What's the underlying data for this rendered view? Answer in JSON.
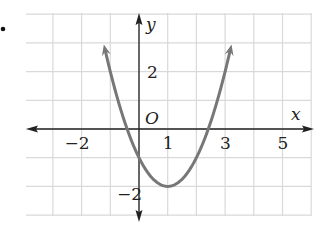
{
  "chart_data": {
    "type": "line",
    "title": "",
    "xlabel": "x",
    "ylabel": "y",
    "origin_label": "O",
    "xlim": [
      -4,
      6
    ],
    "ylim": [
      -3,
      4
    ],
    "grid": true,
    "x_ticks": [
      -2,
      1,
      3,
      5
    ],
    "x_tick_labels": [
      "−2",
      "1",
      "3",
      "5"
    ],
    "y_ticks": [
      2,
      -2
    ],
    "y_tick_labels": [
      "2",
      "−2"
    ],
    "series": [
      {
        "name": "y = x² − 2x − 1",
        "equation": "y = x^2 - 2x - 1",
        "vertex": [
          1,
          -2
        ],
        "y_intercept": -1,
        "roots": [
          -0.41,
          2.41
        ],
        "x": [
          -1.24,
          -1,
          -0.5,
          0,
          0.5,
          1,
          1.5,
          2,
          2.5,
          3,
          3.24
        ],
        "values": [
          4,
          2,
          0.25,
          -1,
          -1.75,
          -2,
          -1.75,
          -1,
          0.25,
          2,
          4
        ],
        "color": "#777777",
        "arrows_at_ends": true
      }
    ]
  },
  "colors": {
    "grid": "#d9d9d9",
    "axis": "#222222",
    "curve": "#777777",
    "bullet": "#111111"
  }
}
